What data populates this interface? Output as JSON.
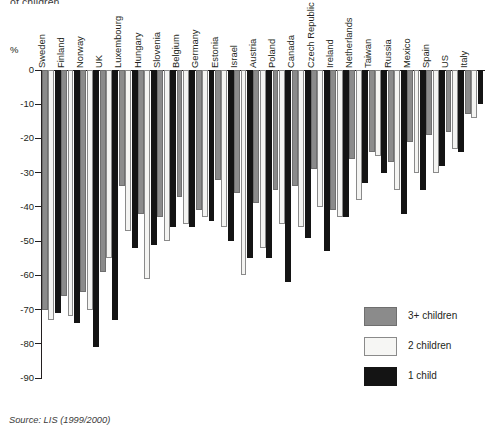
{
  "title_fragment": "of children",
  "axis": {
    "unit_label": "%",
    "y_ticks": [
      "0",
      "-10",
      "-20",
      "-30",
      "-40",
      "-50",
      "-60",
      "-70",
      "-80",
      "-90"
    ]
  },
  "legend": {
    "items": [
      {
        "key": "c3",
        "label": "3+ children",
        "color": "#8b8b8b"
      },
      {
        "key": "c2",
        "label": "2 children",
        "color": "#f4f4f2"
      },
      {
        "key": "c1",
        "label": "1 child",
        "color": "#141414"
      }
    ]
  },
  "source": "Source: LIS (1999/2000)",
  "chart_data": {
    "type": "bar",
    "title": "of children",
    "xlabel": "",
    "ylabel": "%",
    "ylim": [
      -90,
      0
    ],
    "grid": false,
    "legend_position": "bottom-right",
    "categories": [
      "Sweden",
      "Finland",
      "Norway",
      "UK",
      "Luxembourg",
      "Hungary",
      "Slovenia",
      "Belgium",
      "Germany",
      "Estonia",
      "Israel",
      "Austria",
      "Poland",
      "Canada",
      "Czech Republic",
      "Ireland",
      "Netherlands",
      "Taiwan",
      "Russia",
      "Mexico",
      "Spain",
      "US",
      "Italy"
    ],
    "series": [
      {
        "name": "3+ children",
        "color": "#8b8b8b",
        "values": [
          -70,
          -66,
          -65,
          -59,
          -34,
          -42,
          -43,
          -37,
          -41,
          -32,
          -36,
          -39,
          -35,
          -34,
          -29,
          -41,
          -26,
          -24,
          -27,
          -21,
          -19,
          -18,
          -13
        ]
      },
      {
        "name": "2 children",
        "color": "#f4f4f2",
        "values": [
          -73,
          -72,
          -70,
          -55,
          -47,
          -61,
          -50,
          -45,
          -43,
          -46,
          -60,
          -52,
          -45,
          -46,
          -40,
          -43,
          -38,
          -25,
          -35,
          -30,
          -30,
          -23,
          -14
        ]
      },
      {
        "name": "1 child",
        "color": "#141414",
        "values": [
          -71,
          -74,
          -81,
          -73,
          -52,
          -51,
          -46,
          -46,
          -44,
          -50,
          -55,
          -55,
          -62,
          -49,
          -53,
          -43,
          -33,
          -30,
          -42,
          -35,
          -28,
          -24,
          -10
        ]
      }
    ]
  }
}
